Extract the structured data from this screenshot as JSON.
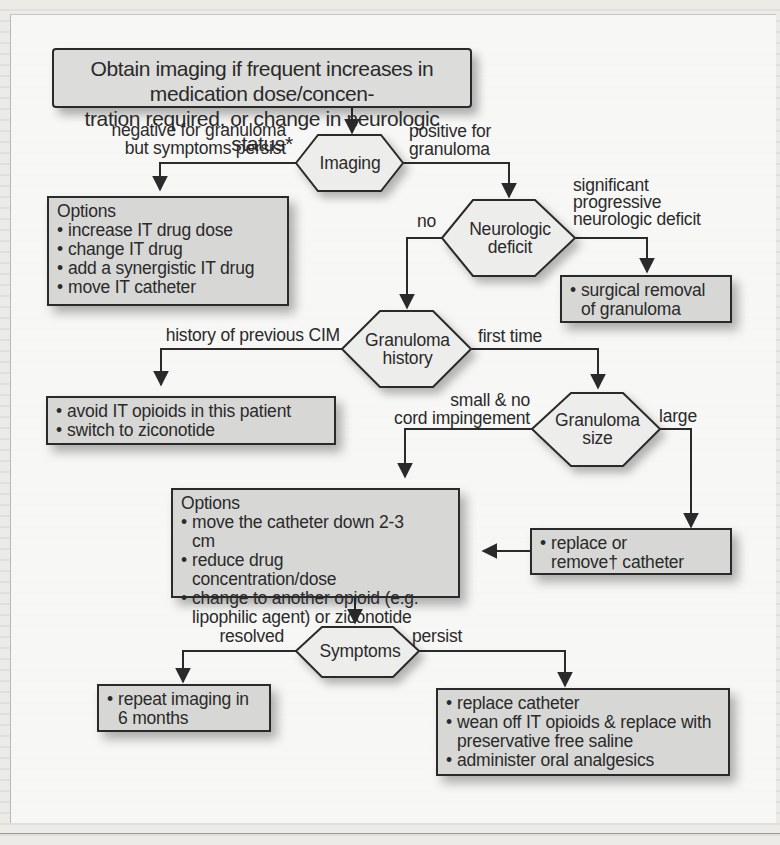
{
  "diagram": {
    "start": {
      "line1": "Obtain imaging if frequent increases in medication dose/concen-",
      "line2": "tration required, or change in neurologic status*"
    },
    "decisions": {
      "imaging": "Imaging",
      "neuro": [
        "Neurologic",
        "deficit"
      ],
      "history": [
        "Granuloma",
        "history"
      ],
      "size": [
        "Granuloma",
        "size"
      ],
      "symptoms": "Symptoms"
    },
    "edge_labels": {
      "negative": [
        "negative for granuloma",
        "but symptoms persist"
      ],
      "positive": [
        "positive for",
        "granuloma"
      ],
      "no": "no",
      "significant": [
        "significant",
        "progressive",
        "neurologic deficit"
      ],
      "history_cim": "history of previous CIM",
      "first_time": "first time",
      "small": [
        "small & no",
        "cord impingement"
      ],
      "large": "large",
      "resolved": "resolved",
      "persist": "persist"
    },
    "boxes": {
      "options1": {
        "title": "Options",
        "items": [
          "increase IT drug dose",
          "change IT drug",
          "add a synergistic IT drug",
          "move IT catheter"
        ]
      },
      "surgical": {
        "items": [
          "surgical removal of granuloma"
        ]
      },
      "avoid": {
        "items": [
          "avoid IT opioids in this patient",
          "switch to ziconotide"
        ]
      },
      "options2": {
        "title": "Options",
        "items": [
          "move the catheter down 2-3 cm",
          "reduce drug concentration/dose",
          "change to another opioid (e.g. lipophilic agent) or ziconotide"
        ]
      },
      "replace_remove": {
        "items": [
          "replace or remove† catheter"
        ]
      },
      "repeat": {
        "items": [
          "repeat imaging in 6 months"
        ]
      },
      "persist_actions": {
        "items": [
          "replace catheter",
          "wean off IT opioids & replace with preservative free saline",
          "administer oral analgesics"
        ]
      }
    },
    "colors": {
      "box_fill": "#d7d7d5",
      "stroke": "#2a2a2a",
      "hex_fill": "#ededeb"
    }
  }
}
